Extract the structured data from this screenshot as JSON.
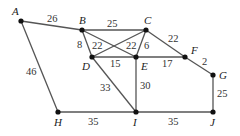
{
  "diagram": {
    "type": "weighted-graph",
    "nodes": [
      {
        "id": "A",
        "label": "A",
        "x": 21,
        "y": 21,
        "lx": 12,
        "ly": 15
      },
      {
        "id": "B",
        "label": "B",
        "x": 82,
        "y": 30,
        "lx": 79,
        "ly": 24
      },
      {
        "id": "C",
        "label": "C",
        "x": 146,
        "y": 30,
        "lx": 144,
        "ly": 24
      },
      {
        "id": "D",
        "label": "D",
        "x": 92,
        "y": 57,
        "lx": 82,
        "ly": 70
      },
      {
        "id": "E",
        "label": "E",
        "x": 136,
        "y": 57,
        "lx": 141,
        "ly": 70
      },
      {
        "id": "F",
        "label": "F",
        "x": 185,
        "y": 57,
        "lx": 191,
        "ly": 54
      },
      {
        "id": "G",
        "label": "G",
        "x": 213,
        "y": 75,
        "lx": 219,
        "ly": 79
      },
      {
        "id": "H",
        "label": "H",
        "x": 58,
        "y": 112,
        "lx": 54,
        "ly": 126
      },
      {
        "id": "I",
        "label": "I",
        "x": 136,
        "y": 112,
        "lx": 133,
        "ly": 126
      },
      {
        "id": "J",
        "label": "J",
        "x": 213,
        "y": 112,
        "lx": 210,
        "ly": 126
      }
    ],
    "edges": [
      {
        "from": "A",
        "to": "B",
        "weight": "26",
        "lx": 47,
        "ly": 22
      },
      {
        "from": "A",
        "to": "H",
        "weight": "46",
        "lx": 26,
        "ly": 75
      },
      {
        "from": "B",
        "to": "C",
        "weight": "25",
        "lx": 107,
        "ly": 27
      },
      {
        "from": "B",
        "to": "D",
        "weight": "8",
        "lx": 77,
        "ly": 48
      },
      {
        "from": "B",
        "to": "E",
        "weight": "22",
        "lx": 92,
        "ly": 49
      },
      {
        "from": "C",
        "to": "D",
        "weight": "22",
        "lx": 126,
        "ly": 49
      },
      {
        "from": "C",
        "to": "E",
        "weight": "6",
        "lx": 144,
        "ly": 49
      },
      {
        "from": "D",
        "to": "E",
        "weight": "15",
        "lx": 110,
        "ly": 67
      },
      {
        "from": "C",
        "to": "F",
        "weight": "22",
        "lx": 168,
        "ly": 42
      },
      {
        "from": "E",
        "to": "F",
        "weight": "17",
        "lx": 162,
        "ly": 67
      },
      {
        "from": "F",
        "to": "G",
        "weight": "2",
        "lx": 202,
        "ly": 65
      },
      {
        "from": "D",
        "to": "I",
        "weight": "33",
        "lx": 100,
        "ly": 91
      },
      {
        "from": "E",
        "to": "I",
        "weight": "30",
        "lx": 140,
        "ly": 89
      },
      {
        "from": "H",
        "to": "I",
        "weight": "35",
        "lx": 88,
        "ly": 125
      },
      {
        "from": "I",
        "to": "J",
        "weight": "35",
        "lx": 168,
        "ly": 125
      },
      {
        "from": "G",
        "to": "J",
        "weight": "25",
        "lx": 217,
        "ly": 97
      }
    ]
  }
}
